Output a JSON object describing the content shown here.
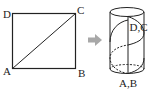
{
  "figure": {
    "square": {
      "vertices": {
        "top_left": "D",
        "top_right": "C",
        "bottom_left": "A",
        "bottom_right": "B"
      },
      "diagonal": "A-C"
    },
    "arrow": {
      "icon": "right-arrow-icon",
      "color": "#a0a0a0"
    },
    "cylinder": {
      "top_label": "D,C",
      "bottom_label": "A,B",
      "seam": "vertical line from A,B to D,C",
      "helix": "diagonal AC wraps once around the lateral surface"
    },
    "colors": {
      "stroke": "#222222",
      "arrow": "#a0a0a0"
    }
  }
}
